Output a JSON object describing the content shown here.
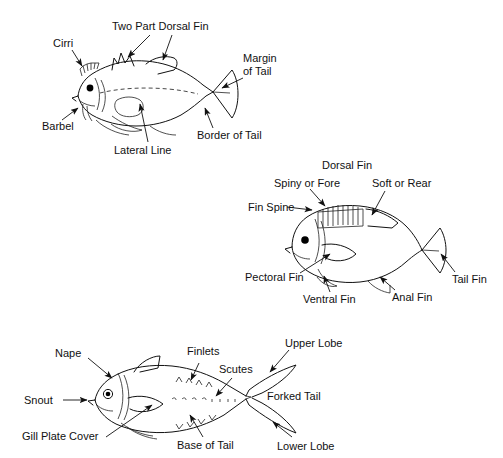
{
  "figure": {
    "background_color": "#ffffff",
    "line_color": "#111111",
    "style": "black-and-white line drawing"
  },
  "panels": [
    {
      "id": "panel-top",
      "fish_type": "generic-spiny-fish-with-cirri",
      "labels": [
        {
          "key": "cirri",
          "text": "Cirri"
        },
        {
          "key": "two_part_dorsal_fin",
          "text": "Two Part Dorsal Fin"
        },
        {
          "key": "margin_of_tail",
          "text": "Margin"
        },
        {
          "key": "margin_of_tail2",
          "text": "of Tail"
        },
        {
          "key": "barbel",
          "text": "Barbel"
        },
        {
          "key": "lateral_line",
          "text": "Lateral Line"
        },
        {
          "key": "border_of_tail",
          "text": "Border of Tail"
        }
      ]
    },
    {
      "id": "panel-middle",
      "fish_type": "perch-like-fish",
      "labels": [
        {
          "key": "dorsal_fin",
          "text": "Dorsal Fin"
        },
        {
          "key": "spiny_or_fore",
          "text": "Spiny or Fore"
        },
        {
          "key": "soft_or_rear",
          "text": "Soft or Rear"
        },
        {
          "key": "fin_spine",
          "text": "Fin Spine"
        },
        {
          "key": "pectoral_fin",
          "text": "Pectoral Fin"
        },
        {
          "key": "ventral_fin",
          "text": "Ventral Fin"
        },
        {
          "key": "anal_fin",
          "text": "Anal Fin"
        },
        {
          "key": "tail_fin",
          "text": "Tail Fin"
        }
      ]
    },
    {
      "id": "panel-bottom",
      "fish_type": "tuna-like-fish",
      "labels": [
        {
          "key": "nape",
          "text": "Nape"
        },
        {
          "key": "finlets",
          "text": "Finlets"
        },
        {
          "key": "scutes",
          "text": "Scutes"
        },
        {
          "key": "upper_lobe",
          "text": "Upper Lobe"
        },
        {
          "key": "snout",
          "text": "Snout"
        },
        {
          "key": "forked_tail",
          "text": "Forked Tail"
        },
        {
          "key": "gill_plate_cover",
          "text": "Gill Plate Cover"
        },
        {
          "key": "base_of_tail",
          "text": "Base of Tail"
        },
        {
          "key": "lower_lobe",
          "text": "Lower Lobe"
        }
      ]
    }
  ]
}
